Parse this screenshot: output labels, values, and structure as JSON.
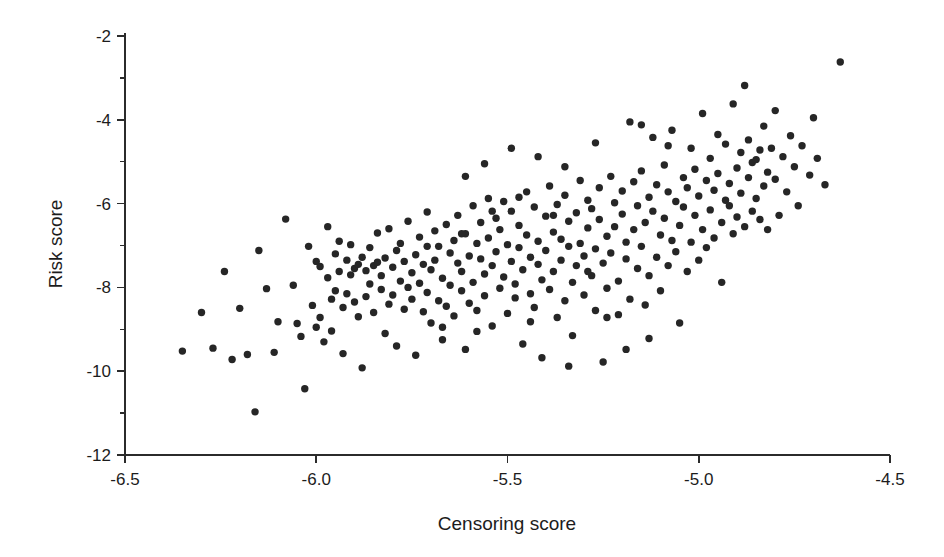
{
  "figure": {
    "background_color": "#ffffff",
    "point_color": "#262626",
    "axis_color": "#2b2b2b"
  },
  "chart_data": {
    "type": "scatter",
    "title": "",
    "subtitle": "",
    "xlabel": "Censoring score",
    "ylabel": "Risk score",
    "xlim": [
      -6.5,
      -4.5
    ],
    "ylim": [
      -12,
      -2
    ],
    "grid": false,
    "legend": null,
    "xticks": [
      -6.5,
      -6.0,
      -5.5,
      -5.0,
      -4.5
    ],
    "xticklabels": [
      "-6.5",
      "-6.0",
      "-5.5",
      "-5.0",
      "-4.5"
    ],
    "yticks": [
      -2,
      -4,
      -6,
      -8,
      -10,
      -12
    ],
    "yticklabels": [
      "-2",
      "-4",
      "-6",
      "-8",
      "-10",
      "-12"
    ],
    "x_minor_ticks": [
      -6.25,
      -5.75,
      -5.25,
      -4.75
    ],
    "y_minor_ticks": [
      -3,
      -5,
      -7,
      -9,
      -11
    ],
    "marker": "circle",
    "marker_size_px": 7.4,
    "n_points": 272,
    "correlation_approx": 0.75,
    "points": [
      [
        -6.35,
        -9.52
      ],
      [
        -6.3,
        -8.6
      ],
      [
        -6.27,
        -9.45
      ],
      [
        -6.24,
        -7.62
      ],
      [
        -6.22,
        -9.72
      ],
      [
        -6.2,
        -8.5
      ],
      [
        -6.18,
        -9.6
      ],
      [
        -6.16,
        -10.97
      ],
      [
        -6.15,
        -7.12
      ],
      [
        -6.13,
        -8.03
      ],
      [
        -6.11,
        -9.55
      ],
      [
        -6.1,
        -8.82
      ],
      [
        -6.08,
        -6.37
      ],
      [
        -6.06,
        -7.95
      ],
      [
        -6.05,
        -8.86
      ],
      [
        -6.04,
        -9.17
      ],
      [
        -6.03,
        -10.42
      ],
      [
        -6.02,
        -7.02
      ],
      [
        -6.01,
        -8.43
      ],
      [
        -6.0,
        -8.95
      ],
      [
        -6.0,
        -7.38
      ],
      [
        -5.99,
        -7.5
      ],
      [
        -5.99,
        -8.72
      ],
      [
        -5.98,
        -9.3
      ],
      [
        -5.97,
        -6.55
      ],
      [
        -5.97,
        -7.77
      ],
      [
        -5.96,
        -8.28
      ],
      [
        -5.96,
        -9.04
      ],
      [
        -5.95,
        -7.2
      ],
      [
        -5.95,
        -8.08
      ],
      [
        -5.94,
        -6.9
      ],
      [
        -5.94,
        -7.62
      ],
      [
        -5.93,
        -8.48
      ],
      [
        -5.93,
        -9.58
      ],
      [
        -5.92,
        -7.35
      ],
      [
        -5.92,
        -8.15
      ],
      [
        -5.91,
        -7.7
      ],
      [
        -5.91,
        -6.98
      ],
      [
        -5.9,
        -7.55
      ],
      [
        -5.9,
        -8.35
      ],
      [
        -5.89,
        -7.45
      ],
      [
        -5.89,
        -8.7
      ],
      [
        -5.88,
        -7.28
      ],
      [
        -5.88,
        -9.92
      ],
      [
        -5.87,
        -7.6
      ],
      [
        -5.87,
        -8.22
      ],
      [
        -5.86,
        -7.05
      ],
      [
        -5.86,
        -7.92
      ],
      [
        -5.85,
        -7.48
      ],
      [
        -5.85,
        -8.6
      ],
      [
        -5.84,
        -6.7
      ],
      [
        -5.84,
        -7.4
      ],
      [
        -5.83,
        -8.05
      ],
      [
        -5.83,
        -7.72
      ],
      [
        -5.82,
        -9.1
      ],
      [
        -5.82,
        -7.3
      ],
      [
        -5.81,
        -8.4
      ],
      [
        -5.81,
        -6.6
      ],
      [
        -5.8,
        -7.52
      ],
      [
        -5.8,
        -8.18
      ],
      [
        -5.79,
        -7.12
      ],
      [
        -5.79,
        -9.4
      ],
      [
        -5.78,
        -7.85
      ],
      [
        -5.78,
        -6.95
      ],
      [
        -5.77,
        -8.52
      ],
      [
        -5.77,
        -7.38
      ],
      [
        -5.76,
        -8.0
      ],
      [
        -5.76,
        -6.42
      ],
      [
        -5.75,
        -7.65
      ],
      [
        -5.75,
        -8.28
      ],
      [
        -5.74,
        -7.22
      ],
      [
        -5.74,
        -9.62
      ],
      [
        -5.73,
        -7.9
      ],
      [
        -5.73,
        -6.8
      ],
      [
        -5.72,
        -8.58
      ],
      [
        -5.72,
        -7.45
      ],
      [
        -5.71,
        -6.2
      ],
      [
        -5.71,
        -8.12
      ],
      [
        -5.7,
        -7.58
      ],
      [
        -5.7,
        -8.85
      ],
      [
        -5.69,
        -6.65
      ],
      [
        -5.69,
        -7.35
      ],
      [
        -5.68,
        -8.32
      ],
      [
        -5.68,
        -7.02
      ],
      [
        -5.67,
        -9.25
      ],
      [
        -5.67,
        -7.78
      ],
      [
        -5.66,
        -6.5
      ],
      [
        -5.66,
        -8.45
      ],
      [
        -5.65,
        -7.18
      ],
      [
        -5.65,
        -7.95
      ],
      [
        -5.64,
        -6.88
      ],
      [
        -5.64,
        -8.68
      ],
      [
        -5.63,
        -7.42
      ],
      [
        -5.63,
        -6.28
      ],
      [
        -5.62,
        -8.08
      ],
      [
        -5.62,
        -7.62
      ],
      [
        -5.61,
        -9.48
      ],
      [
        -5.61,
        -6.72
      ],
      [
        -5.6,
        -7.25
      ],
      [
        -5.6,
        -8.38
      ],
      [
        -5.59,
        -6.05
      ],
      [
        -5.59,
        -7.88
      ],
      [
        -5.58,
        -6.95
      ],
      [
        -5.58,
        -8.55
      ],
      [
        -5.57,
        -7.32
      ],
      [
        -5.57,
        -6.45
      ],
      [
        -5.56,
        -8.2
      ],
      [
        -5.56,
        -7.68
      ],
      [
        -5.55,
        -5.88
      ],
      [
        -5.55,
        -6.82
      ],
      [
        -5.54,
        -7.48
      ],
      [
        -5.54,
        -8.92
      ],
      [
        -5.53,
        -6.35
      ],
      [
        -5.53,
        -7.15
      ],
      [
        -5.52,
        -8.02
      ],
      [
        -5.52,
        -6.62
      ],
      [
        -5.51,
        -7.75
      ],
      [
        -5.51,
        -5.95
      ],
      [
        -5.5,
        -6.98
      ],
      [
        -5.5,
        -8.62
      ],
      [
        -5.49,
        -7.38
      ],
      [
        -5.49,
        -6.18
      ],
      [
        -5.48,
        -7.92
      ],
      [
        -5.48,
        -8.25
      ],
      [
        -5.47,
        -6.52
      ],
      [
        -5.47,
        -7.05
      ],
      [
        -5.46,
        -9.35
      ],
      [
        -5.46,
        -7.58
      ],
      [
        -5.45,
        -5.72
      ],
      [
        -5.45,
        -6.75
      ],
      [
        -5.44,
        -8.15
      ],
      [
        -5.44,
        -7.28
      ],
      [
        -5.43,
        -6.08
      ],
      [
        -5.43,
        -8.48
      ],
      [
        -5.42,
        -7.45
      ],
      [
        -5.42,
        -6.9
      ],
      [
        -5.41,
        -9.68
      ],
      [
        -5.41,
        -7.82
      ],
      [
        -5.4,
        -6.3
      ],
      [
        -5.4,
        -7.12
      ],
      [
        -5.39,
        -8.05
      ],
      [
        -5.39,
        -5.58
      ],
      [
        -5.38,
        -6.68
      ],
      [
        -5.38,
        -7.62
      ],
      [
        -5.37,
        -8.72
      ],
      [
        -5.37,
        -6.02
      ],
      [
        -5.36,
        -7.35
      ],
      [
        -5.36,
        -6.85
      ],
      [
        -5.35,
        -8.32
      ],
      [
        -5.35,
        -5.8
      ],
      [
        -5.34,
        -7.02
      ],
      [
        -5.34,
        -6.42
      ],
      [
        -5.33,
        -7.88
      ],
      [
        -5.33,
        -9.15
      ],
      [
        -5.32,
        -6.22
      ],
      [
        -5.32,
        -7.48
      ],
      [
        -5.31,
        -5.45
      ],
      [
        -5.31,
        -6.95
      ],
      [
        -5.3,
        -8.18
      ],
      [
        -5.3,
        -7.25
      ],
      [
        -5.29,
        -6.58
      ],
      [
        -5.29,
        -5.92
      ],
      [
        -5.28,
        -7.72
      ],
      [
        -5.28,
        -6.12
      ],
      [
        -5.27,
        -8.55
      ],
      [
        -5.27,
        -7.08
      ],
      [
        -5.26,
        -6.38
      ],
      [
        -5.26,
        -5.62
      ],
      [
        -5.25,
        -7.42
      ],
      [
        -5.25,
        -9.78
      ],
      [
        -5.24,
        -6.78
      ],
      [
        -5.24,
        -8.02
      ],
      [
        -5.23,
        -5.35
      ],
      [
        -5.23,
        -7.18
      ],
      [
        -5.22,
        -6.55
      ],
      [
        -5.22,
        -5.98
      ],
      [
        -5.21,
        -7.85
      ],
      [
        -5.21,
        -8.65
      ],
      [
        -5.2,
        -6.25
      ],
      [
        -5.2,
        -5.7
      ],
      [
        -5.19,
        -7.32
      ],
      [
        -5.19,
        -6.92
      ],
      [
        -5.18,
        -4.05
      ],
      [
        -5.18,
        -8.28
      ],
      [
        -5.17,
        -5.48
      ],
      [
        -5.17,
        -6.62
      ],
      [
        -5.16,
        -7.55
      ],
      [
        -5.16,
        -6.05
      ],
      [
        -5.15,
        -5.22
      ],
      [
        -5.15,
        -7.02
      ],
      [
        -5.14,
        -8.42
      ],
      [
        -5.14,
        -6.45
      ],
      [
        -5.13,
        -5.85
      ],
      [
        -5.13,
        -7.72
      ],
      [
        -5.12,
        -4.42
      ],
      [
        -5.12,
        -6.18
      ],
      [
        -5.11,
        -5.55
      ],
      [
        -5.11,
        -7.28
      ],
      [
        -5.1,
        -6.75
      ],
      [
        -5.1,
        -8.08
      ],
      [
        -5.09,
        -5.08
      ],
      [
        -5.09,
        -6.35
      ],
      [
        -5.08,
        -7.48
      ],
      [
        -5.08,
        -5.72
      ],
      [
        -5.07,
        -6.88
      ],
      [
        -5.07,
        -4.25
      ],
      [
        -5.06,
        -5.95
      ],
      [
        -5.06,
        -7.15
      ],
      [
        -5.05,
        -6.52
      ],
      [
        -5.05,
        -8.85
      ],
      [
        -5.04,
        -5.38
      ],
      [
        -5.04,
        -6.08
      ],
      [
        -5.03,
        -7.62
      ],
      [
        -5.03,
        -5.62
      ],
      [
        -5.02,
        -6.92
      ],
      [
        -5.02,
        -4.68
      ],
      [
        -5.01,
        -6.28
      ],
      [
        -5.01,
        -5.18
      ],
      [
        -5.0,
        -7.35
      ],
      [
        -5.0,
        -5.82
      ],
      [
        -4.99,
        -6.62
      ],
      [
        -4.99,
        -3.85
      ],
      [
        -4.98,
        -5.45
      ],
      [
        -4.98,
        -7.05
      ],
      [
        -4.97,
        -6.15
      ],
      [
        -4.97,
        -4.92
      ],
      [
        -4.96,
        -5.68
      ],
      [
        -4.96,
        -6.82
      ],
      [
        -4.95,
        -4.35
      ],
      [
        -4.95,
        -5.28
      ],
      [
        -4.94,
        -6.45
      ],
      [
        -4.94,
        -7.88
      ],
      [
        -4.93,
        -5.92
      ],
      [
        -4.93,
        -4.58
      ],
      [
        -4.92,
        -6.05
      ],
      [
        -4.92,
        -5.52
      ],
      [
        -4.91,
        -6.72
      ],
      [
        -4.91,
        -3.62
      ],
      [
        -4.9,
        -5.15
      ],
      [
        -4.9,
        -6.32
      ],
      [
        -4.89,
        -4.78
      ],
      [
        -4.89,
        -5.75
      ],
      [
        -4.88,
        -3.18
      ],
      [
        -4.88,
        -6.55
      ],
      [
        -4.87,
        -4.48
      ],
      [
        -4.87,
        -5.38
      ],
      [
        -4.86,
        -6.18
      ],
      [
        -4.86,
        -5.02
      ],
      [
        -4.85,
        -4.95
      ],
      [
        -4.85,
        -5.88
      ],
      [
        -4.84,
        -4.72
      ],
      [
        -4.84,
        -6.38
      ],
      [
        -4.83,
        -4.15
      ],
      [
        -4.83,
        -5.58
      ],
      [
        -4.82,
        -5.25
      ],
      [
        -4.82,
        -6.62
      ],
      [
        -4.81,
        -4.68
      ],
      [
        -4.8,
        -3.78
      ],
      [
        -4.8,
        -5.42
      ],
      [
        -4.79,
        -6.28
      ],
      [
        -4.78,
        -4.88
      ],
      [
        -4.77,
        -5.72
      ],
      [
        -4.76,
        -4.38
      ],
      [
        -4.75,
        -5.12
      ],
      [
        -4.74,
        -6.05
      ],
      [
        -4.73,
        -4.62
      ],
      [
        -4.71,
        -5.32
      ],
      [
        -4.7,
        -3.95
      ],
      [
        -4.69,
        -4.92
      ],
      [
        -4.67,
        -5.55
      ],
      [
        -4.63,
        -2.62
      ],
      [
        -5.54,
        -6.18
      ],
      [
        -5.62,
        -6.72
      ],
      [
        -5.47,
        -5.85
      ],
      [
        -5.71,
        -7.02
      ],
      [
        -5.38,
        -6.28
      ],
      [
        -5.29,
        -7.62
      ],
      [
        -5.44,
        -8.82
      ],
      [
        -5.58,
        -9.05
      ],
      [
        -5.34,
        -9.88
      ],
      [
        -5.67,
        -8.95
      ],
      [
        -5.19,
        -9.48
      ],
      [
        -5.24,
        -8.72
      ],
      [
        -5.13,
        -9.22
      ],
      [
        -5.49,
        -4.68
      ],
      [
        -5.56,
        -5.05
      ],
      [
        -5.42,
        -4.88
      ],
      [
        -5.61,
        -5.35
      ],
      [
        -5.35,
        -5.12
      ],
      [
        -5.27,
        -4.55
      ],
      [
        -5.15,
        -4.12
      ],
      [
        -5.08,
        -4.62
      ]
    ]
  },
  "axes": {
    "x_title": "Censoring score",
    "y_title": "Risk score"
  }
}
